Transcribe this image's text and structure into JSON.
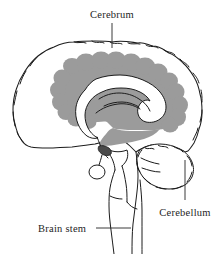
{
  "figure": {
    "background_color": "#ffffff",
    "line_color": "#1c1c1c",
    "shading_color": "#9b9b9b",
    "fill_color": "#ffffff"
  },
  "labels": [
    {
      "id": "cerebrum",
      "text": "Cerebrum",
      "position": "top-center",
      "text_x": 112,
      "text_y": 18,
      "anchor": "middle",
      "leader": {
        "x1": 112,
        "y1": 23,
        "x2": 112,
        "y2": 48
      }
    },
    {
      "id": "cerebellum",
      "text": "Cerebellum",
      "position": "bottom-right",
      "text_x": 185,
      "text_y": 213,
      "anchor": "middle",
      "leader": {
        "x1": 185,
        "y1": 198,
        "x2": 185,
        "y2": 160
      }
    },
    {
      "id": "brain-stem",
      "text": "Brain stem",
      "position": "bottom-left",
      "text_x": 38,
      "text_y": 231,
      "anchor": "start",
      "leader": {
        "x1": 95,
        "y1": 228,
        "x2": 130,
        "y2": 228
      }
    }
  ],
  "structures": [
    {
      "id": "cerebral-cortex",
      "name": "Cerebral cortex outline",
      "shaded": false
    },
    {
      "id": "white-matter-band",
      "name": "Shaded inner band",
      "shaded": true
    },
    {
      "id": "corpus-callosum",
      "name": "Corpus callosum",
      "shaded": false
    },
    {
      "id": "pituitary-gland",
      "name": "Pituitary gland",
      "shaded": false
    },
    {
      "id": "cerebellum-body",
      "name": "Cerebellum",
      "shaded": false
    },
    {
      "id": "brain-stem-body",
      "name": "Brain stem",
      "shaded": false
    }
  ]
}
